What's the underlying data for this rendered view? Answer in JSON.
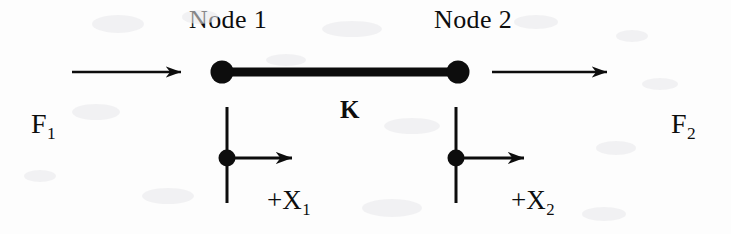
{
  "figure": {
    "kind": "spring-element-free-body-diagram",
    "background_color": "#fdfdfd",
    "ink_color": "#0d0d0d",
    "width": 731,
    "height": 234
  },
  "labels": {
    "node1": "Node 1",
    "node2": "Node 2",
    "stiffness": "K",
    "force1_base": "F",
    "force1_sub": "1",
    "force2_base": "F",
    "force2_sub": "2",
    "disp1_base": "+X",
    "disp1_sub": "1",
    "disp2_base": "+X",
    "disp2_sub": "2"
  },
  "geometry": {
    "element_bar": {
      "x1": 222,
      "y1": 72,
      "x2": 458,
      "y2": 72,
      "thickness": 8
    },
    "node1_dot": {
      "cx": 222,
      "cy": 72,
      "r": 11
    },
    "node2_dot": {
      "cx": 458,
      "cy": 72,
      "r": 11
    },
    "force1_arrow": {
      "x1": 72,
      "y1": 72,
      "x2": 196,
      "y2": 72
    },
    "force2_arrow": {
      "x1": 492,
      "y1": 72,
      "x2": 622,
      "y2": 72
    },
    "node1_axis": {
      "x": 227,
      "y1": 107,
      "y2": 203
    },
    "node2_axis": {
      "x": 456,
      "y1": 107,
      "y2": 203
    },
    "node1_mid_dot": {
      "cx": 227,
      "cy": 158,
      "r": 8
    },
    "node2_mid_dot": {
      "cx": 456,
      "cy": 158,
      "r": 8
    },
    "disp1_arrow": {
      "x1": 233,
      "y1": 158,
      "x2": 308,
      "y2": 158
    },
    "disp2_arrow": {
      "x1": 462,
      "y1": 158,
      "x2": 540,
      "y2": 158
    }
  },
  "label_positions": {
    "node1": {
      "left": 189,
      "top": 7
    },
    "node2": {
      "left": 434,
      "top": 7
    },
    "stiffness": {
      "left": 340,
      "top": 97
    },
    "force1": {
      "left": 31,
      "top": 110
    },
    "force2": {
      "left": 671,
      "top": 110
    },
    "disp1": {
      "left": 267,
      "top": 187
    },
    "disp2": {
      "left": 511,
      "top": 187
    }
  }
}
